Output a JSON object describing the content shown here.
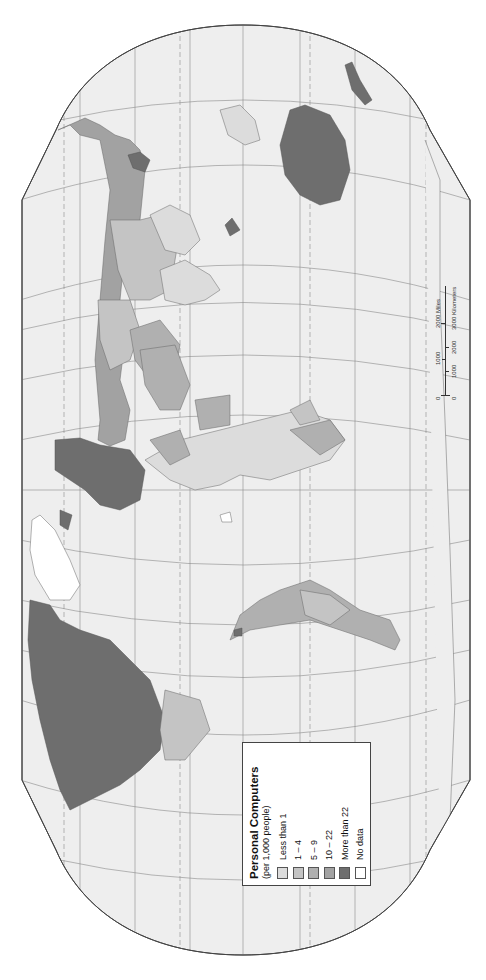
{
  "legend": {
    "title": "Personal Computers",
    "subtitle": "(per 1,000 people)",
    "classes": [
      {
        "label": "Less than 1",
        "color": "#dcdcdc"
      },
      {
        "label": "1 – 4",
        "color": "#c4c4c4"
      },
      {
        "label": "5 – 9",
        "color": "#b0b0b0"
      },
      {
        "label": "10 – 22",
        "color": "#a2a2a2"
      },
      {
        "label": "More than 22",
        "color": "#6e6e6e"
      },
      {
        "label": "No data",
        "color": "#ffffff"
      }
    ]
  },
  "scale_bar": {
    "miles_labels": [
      "0",
      "1000",
      "2000 Miles"
    ],
    "km_labels": [
      "0",
      "1000",
      "2000",
      "3000 Kilometers"
    ]
  },
  "map": {
    "orientation": "rotated 90° counter-clockwise (north at left)",
    "ocean_color": "#eeeeee",
    "outline_color": "#444444",
    "graticule_color": "#8a8a8a"
  }
}
